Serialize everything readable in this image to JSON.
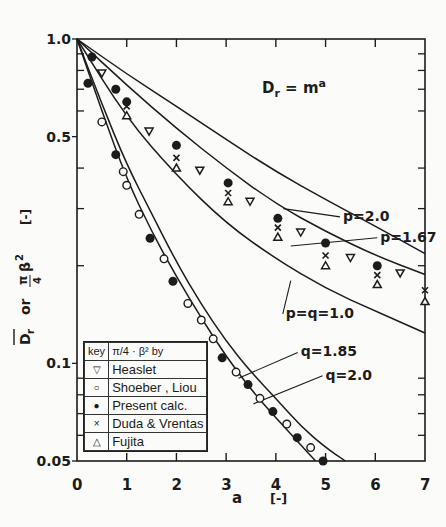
{
  "chart_data": {
    "type": "line",
    "title": "",
    "annotation": "D_r = m^a",
    "xlabel": "a   [-]",
    "ylabel": "D̄r  or  π/4·β²  [-]",
    "xlim": [
      0,
      7
    ],
    "ylim": [
      0.05,
      1.0
    ],
    "yscale": "log",
    "x_ticks": [
      0,
      1,
      2,
      3,
      4,
      5,
      6,
      7
    ],
    "y_tick_labels": [
      "1.0",
      "0.5",
      "0.1",
      "0.05"
    ],
    "y_tick_values": [
      1.0,
      0.5,
      0.1,
      0.05
    ],
    "y_minor_ticks": [
      0.9,
      0.8,
      0.7,
      0.6,
      0.4,
      0.3,
      0.2,
      0.09,
      0.08,
      0.07,
      0.06
    ],
    "grid": false,
    "curves": [
      {
        "name": "p=2.0",
        "x": [
          0,
          1,
          2,
          3,
          4,
          5,
          6,
          7
        ],
        "y": [
          1.0,
          0.78,
          0.62,
          0.49,
          0.39,
          0.32,
          0.265,
          0.218
        ]
      },
      {
        "name": "p=1.67",
        "x": [
          0,
          1,
          2,
          3,
          4,
          5,
          6,
          7
        ],
        "y": [
          1.0,
          0.72,
          0.53,
          0.4,
          0.31,
          0.255,
          0.215,
          0.188
        ]
      },
      {
        "name": "p=q=1.0",
        "x": [
          0,
          1,
          2,
          3,
          4,
          5,
          6,
          7
        ],
        "y": [
          1.0,
          0.57,
          0.38,
          0.27,
          0.21,
          0.17,
          0.145,
          0.124
        ]
      },
      {
        "name": "q=1.85",
        "x": [
          0,
          0.5,
          1,
          1.5,
          2,
          2.5,
          3,
          3.5,
          4,
          4.5,
          5,
          5.4
        ],
        "y": [
          1.0,
          0.63,
          0.41,
          0.29,
          0.205,
          0.152,
          0.117,
          0.094,
          0.078,
          0.064,
          0.055,
          0.05
        ]
      },
      {
        "name": "q=2.0",
        "x": [
          0,
          0.5,
          1,
          1.5,
          2,
          2.5,
          3,
          3.5,
          4,
          4.5,
          4.8
        ],
        "y": [
          1.0,
          0.6,
          0.37,
          0.255,
          0.185,
          0.138,
          0.105,
          0.083,
          0.068,
          0.056,
          0.05
        ]
      }
    ],
    "curve_labels": [
      {
        "text": "p=2.0",
        "x": 5.35,
        "y": 0.275,
        "lead_to": [
          4.15,
          0.3
        ]
      },
      {
        "text": "p=1.67",
        "x": 6.1,
        "y": 0.237,
        "lead_to": [
          4.3,
          0.23
        ]
      },
      {
        "text": "p=q=1.0",
        "x": 4.2,
        "y": 0.138,
        "lead_to": [
          4.3,
          0.18
        ]
      },
      {
        "text": "q=1.85",
        "x": 4.5,
        "y": 0.105,
        "lead_to": [
          3.25,
          0.09
        ]
      },
      {
        "text": "q=2.0",
        "x": 5.0,
        "y": 0.089,
        "lead_to": [
          3.55,
          0.075
        ]
      }
    ],
    "series": [
      {
        "name": "Heaslet",
        "marker": "triangle-down",
        "x": [
          0.5,
          1.45,
          2.47,
          3.48,
          4.5,
          5.5,
          6.5
        ],
        "y": [
          0.785,
          0.52,
          0.394,
          0.316,
          0.254,
          0.212,
          0.19
        ]
      },
      {
        "name": "Shoeber , Liou",
        "marker": "circle-open",
        "x": [
          0.5,
          0.93,
          1.0,
          1.25,
          1.75,
          2.23,
          2.5,
          2.74,
          3.2,
          3.68,
          4.22,
          4.7
        ],
        "y": [
          0.555,
          0.39,
          0.354,
          0.288,
          0.21,
          0.153,
          0.136,
          0.119,
          0.094,
          0.078,
          0.065,
          0.055
        ]
      },
      {
        "name": "Present calc.",
        "marker": "circle-filled",
        "x": [
          0.3,
          0.78,
          1.0,
          2.0,
          3.04,
          4.04,
          5.0,
          6.04,
          0.22,
          0.78,
          1.47,
          1.93,
          2.92,
          3.44,
          3.94,
          4.43,
          4.95
        ],
        "y": [
          0.88,
          0.7,
          0.64,
          0.47,
          0.36,
          0.28,
          0.235,
          0.2,
          0.73,
          0.44,
          0.243,
          0.179,
          0.104,
          0.086,
          0.071,
          0.059,
          0.05
        ]
      },
      {
        "name": "Duda & Vrentas",
        "marker": "x",
        "x": [
          1.0,
          2.0,
          3.04,
          4.04,
          5.0,
          6.04,
          7.0
        ],
        "y": [
          0.62,
          0.43,
          0.335,
          0.262,
          0.215,
          0.187,
          0.168
        ]
      },
      {
        "name": "Fujita",
        "marker": "triangle-up",
        "x": [
          1.0,
          2.0,
          3.04,
          4.04,
          5.0,
          6.04,
          7.0
        ],
        "y": [
          0.58,
          0.4,
          0.315,
          0.245,
          0.2,
          0.175,
          0.155
        ]
      }
    ],
    "legend": {
      "position": "lower-left",
      "header": [
        "key",
        "π/4 · β²   by"
      ],
      "entries": [
        {
          "symbol": "▽",
          "label": "Heaslet"
        },
        {
          "symbol": "○",
          "label": "Shoeber , Liou"
        },
        {
          "symbol": "●",
          "label": "Present calc."
        },
        {
          "symbol": "×",
          "label": "Duda & Vrentas"
        },
        {
          "symbol": "△",
          "label": "Fujita"
        }
      ]
    }
  },
  "labels": {
    "annotation_main": "D",
    "annotation_sub": "r",
    "annotation_rest": " = m",
    "annotation_sup": "a",
    "x_axis": "a",
    "x_unit": "[-]"
  },
  "colors": {
    "ink": "#1c1c1c",
    "paper": "#fbfbf9"
  }
}
